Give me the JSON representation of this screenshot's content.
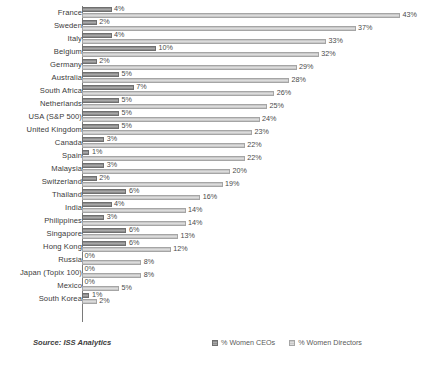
{
  "chart_data": {
    "type": "bar",
    "orientation": "horizontal",
    "grouped": true,
    "title": "",
    "xlabel": "",
    "ylabel": "",
    "xlim": [
      0,
      43
    ],
    "grid": false,
    "legend_position": "bottom-center",
    "categories": [
      "France",
      "Sweden",
      "Italy",
      "Belgium",
      "Germany",
      "Australia",
      "South Africa",
      "Netherlands",
      "USA (S&P 500)",
      "United Kingdom",
      "Canada",
      "Spain",
      "Malaysia",
      "Switzerland",
      "Thailand",
      "India",
      "Philippines",
      "Singapore",
      "Hong Kong",
      "Russia",
      "Japan (Topix 100)",
      "Mexico",
      "South Korea"
    ],
    "series": [
      {
        "name": "% Women CEOs",
        "color": "#9a9a9a",
        "values": [
          4,
          2,
          4,
          10,
          2,
          5,
          7,
          5,
          5,
          5,
          3,
          1,
          3,
          2,
          6,
          4,
          3,
          6,
          6,
          0,
          0,
          0,
          1
        ],
        "labels": [
          "4%",
          "2%",
          "4%",
          "10%",
          "2%",
          "5%",
          "7%",
          "5%",
          "5%",
          "5%",
          "3%",
          "1%",
          "3%",
          "2%",
          "6%",
          "4%",
          "3%",
          "6%",
          "6%",
          "0%",
          "0%",
          "0%",
          "1%"
        ]
      },
      {
        "name": "% Women Directors",
        "color": "#d2d2d2",
        "values": [
          43,
          37,
          33,
          32,
          29,
          28,
          26,
          25,
          24,
          23,
          22,
          22,
          20,
          19,
          16,
          14,
          14,
          13,
          12,
          8,
          8,
          5,
          2
        ],
        "labels": [
          "43%",
          "37%",
          "33%",
          "32%",
          "29%",
          "28%",
          "26%",
          "25%",
          "24%",
          "23%",
          "22%",
          "22%",
          "20%",
          "19%",
          "16%",
          "14%",
          "14%",
          "13%",
          "12%",
          "8%",
          "8%",
          "5%",
          "2%"
        ]
      }
    ]
  },
  "footer": {
    "source": "Source: ISS Analytics"
  }
}
